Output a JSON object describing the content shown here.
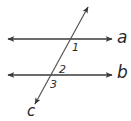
{
  "figure": {
    "top_cutoff_text": "",
    "lines": [
      {
        "id": "a",
        "label": "a",
        "type": "parallel",
        "y": 39,
        "x1": 8,
        "x2": 112
      },
      {
        "id": "b",
        "label": "b",
        "type": "parallel",
        "y": 75,
        "x1": 8,
        "x2": 112
      },
      {
        "id": "c",
        "label": "c",
        "type": "transversal",
        "x1": 88,
        "y1": 7,
        "x2": 35,
        "y2": 104
      }
    ],
    "angles": [
      {
        "id": "1",
        "label": "1",
        "position": "below-right of intersection c∩a"
      },
      {
        "id": "2",
        "label": "2",
        "position": "above-right of intersection c∩b"
      },
      {
        "id": "3",
        "label": "3",
        "position": "below-right of intersection c∩b"
      }
    ],
    "colors": {
      "line": "#3a3a3a",
      "text": "#2a2a2a"
    }
  }
}
